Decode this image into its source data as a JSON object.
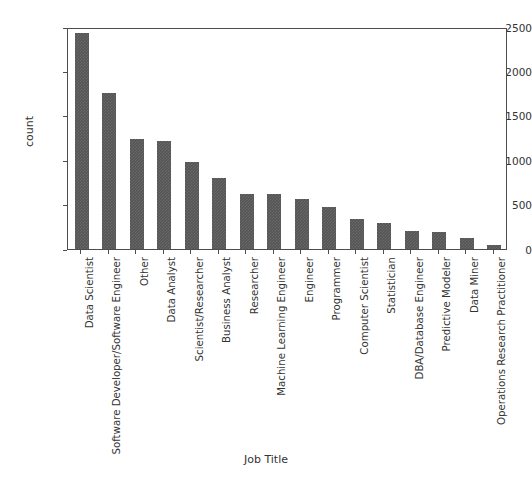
{
  "chart_data": {
    "type": "bar",
    "title": "",
    "xlabel": "Job Title",
    "ylabel": "count",
    "ylim": [
      0,
      2500
    ],
    "yticks": [
      0,
      500,
      1000,
      1500,
      2000,
      2500
    ],
    "ytick_labels": [
      "0",
      "500",
      "1000",
      "1500",
      "2000",
      "2500"
    ],
    "grid": false,
    "legend": null,
    "bar_color": "#555555",
    "categories": [
      "Data Scientist",
      "Software Developer/Software Engineer",
      "Other",
      "Data Analyst",
      "Scientist/Researcher",
      "Business Analyst",
      "Researcher",
      "Machine Learning Engineer",
      "Engineer",
      "Programmer",
      "Computer Scientist",
      "Statistician",
      "DBA/Database Engineer",
      "Predictive Modeler",
      "Data Miner",
      "Operations Research Practitioner"
    ],
    "values": [
      2432,
      1761,
      1240,
      1217,
      975,
      795,
      625,
      625,
      560,
      470,
      340,
      295,
      200,
      195,
      120,
      45
    ]
  }
}
